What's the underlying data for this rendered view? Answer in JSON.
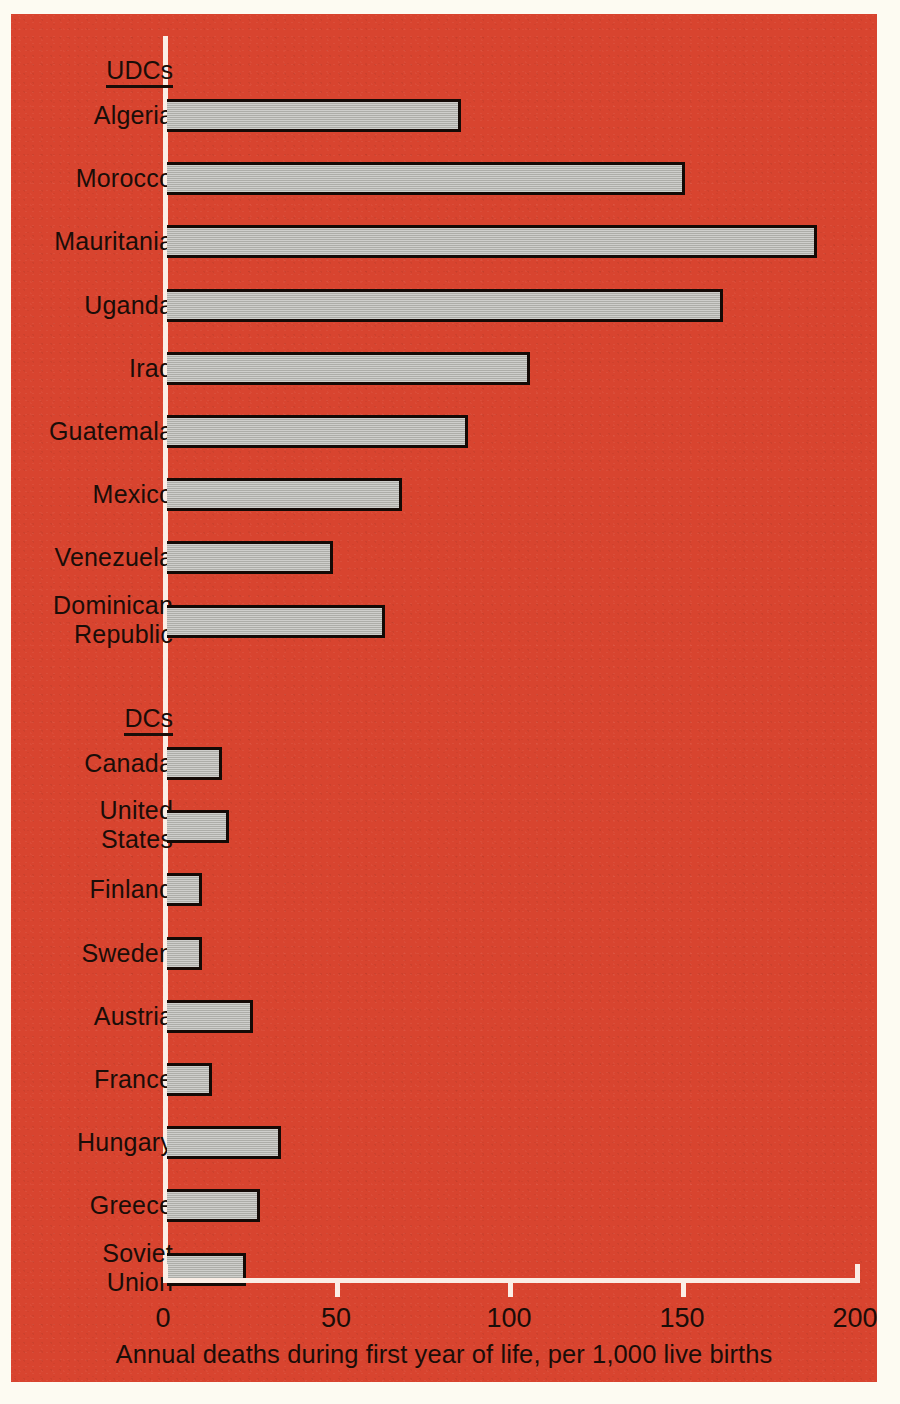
{
  "figure": {
    "background_color": "#d8442f",
    "bar_fill_color": "#b6b6b1",
    "bar_edge_color": "#140a06",
    "axis_color": "#fbeee6",
    "text_color": "#1a0d08"
  },
  "groups": [
    {
      "id": "udcs",
      "label": "UDCs"
    },
    {
      "id": "dcs",
      "label": "DCs"
    }
  ],
  "axis": {
    "title": "Annual deaths during first year of life, per 1,000 live births",
    "ticks": [
      "0",
      "50",
      "100",
      "150",
      "200"
    ],
    "min": 0,
    "max": 200
  },
  "chart_data": {
    "type": "bar",
    "orientation": "horizontal",
    "title": "",
    "subtitle": "",
    "xlabel": "Annual deaths during first year of life, per 1,000 live births",
    "ylabel": "",
    "xlim": [
      0,
      200
    ],
    "xticks": [
      0,
      50,
      100,
      150,
      200
    ],
    "grid": false,
    "legend": false,
    "group_labels": [
      "UDCs",
      "DCs"
    ],
    "categories": [
      "Algeria",
      "Morocco",
      "Mauritania",
      "Uganda",
      "Iraq",
      "Guatemala",
      "Mexico",
      "Venezuela",
      "Dominican Republic",
      "Canada",
      "United States",
      "Finland",
      "Sweden",
      "Austria",
      "France",
      "Hungary",
      "Greece",
      "Soviet Union"
    ],
    "values": [
      85,
      150,
      188,
      161,
      105,
      87,
      68,
      48,
      63,
      16,
      18,
      10,
      10,
      25,
      13,
      33,
      27,
      23
    ],
    "series": [
      {
        "name": "Infant mortality rate",
        "values": [
          85,
          150,
          188,
          161,
          105,
          87,
          68,
          48,
          63,
          16,
          18,
          10,
          10,
          25,
          13,
          33,
          27,
          23
        ]
      }
    ],
    "groups": [
      {
        "label": "UDCs",
        "items": [
          {
            "label": "Algeria",
            "label_lines": [
              "Algeria"
            ],
            "value": 85
          },
          {
            "label": "Morocco",
            "label_lines": [
              "Morocco"
            ],
            "value": 150
          },
          {
            "label": "Mauritania",
            "label_lines": [
              "Mauritania"
            ],
            "value": 188
          },
          {
            "label": "Uganda",
            "label_lines": [
              "Uganda"
            ],
            "value": 161
          },
          {
            "label": "Iraq",
            "label_lines": [
              "Iraq"
            ],
            "value": 105
          },
          {
            "label": "Guatemala",
            "label_lines": [
              "Guatemala"
            ],
            "value": 87
          },
          {
            "label": "Mexico",
            "label_lines": [
              "Mexico"
            ],
            "value": 68
          },
          {
            "label": "Venezuela",
            "label_lines": [
              "Venezuela"
            ],
            "value": 48
          },
          {
            "label": "Dominican Republic",
            "label_lines": [
              "Dominican",
              "Republic"
            ],
            "value": 63
          }
        ]
      },
      {
        "label": "DCs",
        "items": [
          {
            "label": "Canada",
            "label_lines": [
              "Canada"
            ],
            "value": 16
          },
          {
            "label": "United States",
            "label_lines": [
              "United",
              "States"
            ],
            "value": 18
          },
          {
            "label": "Finland",
            "label_lines": [
              "Finland"
            ],
            "value": 10
          },
          {
            "label": "Sweden",
            "label_lines": [
              "Sweden"
            ],
            "value": 10
          },
          {
            "label": "Austria",
            "label_lines": [
              "Austria"
            ],
            "value": 25
          },
          {
            "label": "France",
            "label_lines": [
              "France"
            ],
            "value": 13
          },
          {
            "label": "Hungary",
            "label_lines": [
              "Hungary"
            ],
            "value": 33
          },
          {
            "label": "Greece",
            "label_lines": [
              "Greece"
            ],
            "value": 27
          },
          {
            "label": "Soviet Union",
            "label_lines": [
              "Soviet",
              "Union"
            ],
            "value": 23
          }
        ]
      }
    ]
  }
}
